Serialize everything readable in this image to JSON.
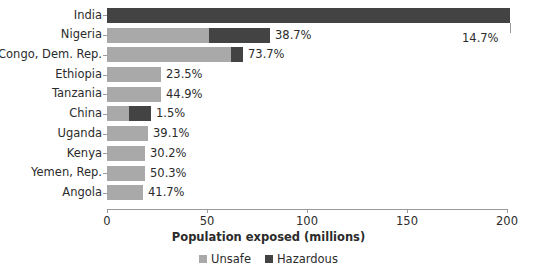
{
  "chart_data": {
    "type": "bar",
    "orientation": "horizontal",
    "stacked": true,
    "title": "",
    "xlabel": "Population exposed (millions)",
    "ylabel": "",
    "xlim": [
      0,
      200
    ],
    "xticks": [
      0,
      50,
      100,
      150,
      200
    ],
    "xtick_labels": [
      "0",
      "50",
      "100",
      "150",
      "200"
    ],
    "grid": false,
    "legend_position": "bottom",
    "categories": [
      "India",
      "Nigeria",
      "Congo, Dem. Rep.",
      "Ethiopia",
      "Tanzania",
      "China",
      "Uganda",
      "Kenya",
      "Yemen, Rep.",
      "Angola"
    ],
    "series": [
      {
        "name": "Unsafe",
        "color": "#a9a9a9",
        "values": [
          0,
          51.0,
          62.0,
          27.0,
          27.0,
          11.0,
          20.5,
          19.0,
          19.0,
          18.0
        ]
      },
      {
        "name": "Hazardous",
        "color": "#434343",
        "values": [
          201.5,
          30.5,
          6.0,
          0,
          0,
          11.0,
          0,
          0,
          0,
          0
        ]
      }
    ],
    "data_labels": [
      "14.7%",
      "38.7%",
      "73.7%",
      "23.5%",
      "44.9%",
      "1.5%",
      "39.1%",
      "30.2%",
      "50.3%",
      "41.7%"
    ]
  },
  "legend": {
    "items": [
      {
        "label": "Unsafe",
        "color": "#a9a9a9"
      },
      {
        "label": "Hazardous",
        "color": "#434343"
      }
    ]
  },
  "colors": {
    "unsafe": "#a9a9a9",
    "hazardous": "#434343",
    "axis": "#9a9a9a",
    "text": "#2b2b2b",
    "background": "#ffffff"
  }
}
